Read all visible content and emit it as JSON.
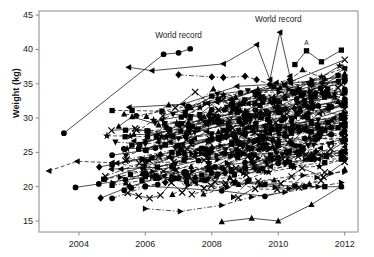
{
  "chart_data": {
    "type": "line",
    "title": "",
    "xlabel": "",
    "ylabel": "Weight (kg)",
    "xlim": [
      2002.8,
      2012.4
    ],
    "ylim": [
      13.4,
      45.6
    ],
    "xticks": [
      2004,
      2006,
      2008,
      2010,
      2012
    ],
    "xtick_labels": [
      "2004",
      "2006",
      "2008",
      "2010",
      "2012"
    ],
    "yticks": [
      15,
      20,
      25,
      30,
      35,
      40,
      45
    ],
    "ytick_labels": [
      "15",
      "20",
      "25",
      "30",
      "35",
      "40",
      "45"
    ],
    "grid": false,
    "legend": "none",
    "frame": "full-box",
    "marker_types": [
      "circle",
      "square",
      "triangle-up",
      "triangle-down",
      "triangle-left",
      "triangle-right",
      "diamond",
      "star",
      "x"
    ],
    "line_styles": [
      "solid",
      "dashed",
      "dash-dot"
    ],
    "color": "#000000",
    "annotations": [
      {
        "text": "World record",
        "x": 2007.0,
        "y": 41.6,
        "anchor": "middle"
      },
      {
        "text": "World record",
        "x": 2010.0,
        "y": 44.0,
        "anchor": "middle"
      },
      {
        "text": "A",
        "x": 2010.85,
        "y": 40.7,
        "anchor": "middle"
      },
      {
        "text": "B",
        "x": 2011.65,
        "y": 32.3,
        "anchor": "middle"
      }
    ],
    "series": [
      {
        "name": "world-record-early",
        "marker": "circle",
        "line": "solid",
        "x": [
          2003.55,
          2006.55,
          2007.0,
          2007.35
        ],
        "y": [
          27.8,
          39.3,
          39.5,
          40.1
        ]
      },
      {
        "name": "world-record-late",
        "marker": "triangle-left",
        "line": "solid",
        "x": [
          2005.5,
          2006.2,
          2008.35,
          2009.35,
          2009.75,
          2010.05,
          2010.35
        ],
        "y": [
          37.4,
          36.9,
          37.9,
          40.7,
          35.6,
          42.5,
          36.1
        ]
      },
      {
        "name": "diamond-high",
        "marker": "diamond",
        "line": "dash-dot",
        "x": [
          2007.0,
          2008.0,
          2008.35,
          2009.0,
          2009.35,
          2009.75,
          2010.35,
          2011.0,
          2011.8
        ],
        "y": [
          36.3,
          36.0,
          35.9,
          36.1,
          35.6,
          34.9,
          35.6,
          34.9,
          35.3
        ]
      },
      {
        "name": "square-31",
        "marker": "square",
        "line": "dashed",
        "x": [
          2005.0,
          2005.6,
          2006.5,
          2007.2,
          2008.0,
          2008.6,
          2009.4,
          2010.2,
          2011.0,
          2011.8
        ],
        "y": [
          31.1,
          31.1,
          31.0,
          30.8,
          33.2,
          32.0,
          33.5,
          34.8,
          35.0,
          36.2
        ]
      },
      {
        "name": "x-series-mid",
        "marker": "x",
        "line": "solid",
        "x": [
          2006.9,
          2007.5,
          2008.2,
          2009.0,
          2009.8,
          2010.6,
          2011.4,
          2011.9
        ],
        "y": [
          31.5,
          33.8,
          31.2,
          32.3,
          33.0,
          33.8,
          34.6,
          34.9
        ]
      },
      {
        "name": "triangle-up-mid",
        "marker": "triangle-up",
        "line": "solid",
        "x": [
          2005.2,
          2005.6,
          2006.4,
          2007.3,
          2008.2,
          2009.1,
          2010.0,
          2010.9,
          2011.8
        ],
        "y": [
          28.8,
          30.2,
          29.0,
          29.4,
          29.9,
          30.4,
          31.2,
          31.6,
          32.4
        ]
      },
      {
        "name": "triangle-down-mid",
        "marker": "triangle-down",
        "line": "dash-dot",
        "x": [
          2005.1,
          2006.0,
          2007.0,
          2008.0,
          2009.0,
          2010.0,
          2011.0,
          2011.9
        ],
        "y": [
          26.5,
          26.2,
          27.0,
          27.5,
          28.3,
          28.8,
          29.5,
          30.4
        ]
      },
      {
        "name": "circle-mid-a",
        "marker": "circle",
        "line": "solid",
        "x": [
          2005.0,
          2006.0,
          2007.0,
          2008.0,
          2009.0,
          2010.0,
          2011.0,
          2011.9
        ],
        "y": [
          24.6,
          25.3,
          26.0,
          27.0,
          27.8,
          28.6,
          29.2,
          30.0
        ]
      },
      {
        "name": "square-mid-a",
        "marker": "square",
        "line": "dashed",
        "x": [
          2005.0,
          2005.9,
          2006.8,
          2007.7,
          2008.6,
          2009.5,
          2010.4,
          2011.3,
          2011.9
        ],
        "y": [
          23.2,
          24.0,
          25.0,
          25.6,
          26.4,
          27.0,
          27.8,
          28.4,
          29.0
        ]
      },
      {
        "name": "triangle-left-low",
        "marker": "triangle-left",
        "line": "dashed",
        "x": [
          2003.1,
          2003.95,
          2005.0,
          2006.1,
          2007.2,
          2008.3,
          2009.4,
          2010.5,
          2011.6
        ],
        "y": [
          22.3,
          23.7,
          23.5,
          23.9,
          24.3,
          24.9,
          25.4,
          25.9,
          26.4
        ]
      },
      {
        "name": "circle-low-a",
        "marker": "circle",
        "line": "solid",
        "x": [
          2003.9,
          2004.6,
          2005.4,
          2006.3,
          2007.2,
          2008.1,
          2009.0,
          2010.0,
          2011.0,
          2011.9
        ],
        "y": [
          19.9,
          20.4,
          21.0,
          21.6,
          22.2,
          22.9,
          23.5,
          24.2,
          24.6,
          25.0
        ]
      },
      {
        "name": "square-low-b",
        "marker": "square",
        "line": "dash-dot",
        "x": [
          2005.0,
          2005.9,
          2006.8,
          2007.7,
          2008.6,
          2009.5,
          2010.4,
          2011.4,
          2011.9
        ],
        "y": [
          20.2,
          20.9,
          21.4,
          21.7,
          22.2,
          22.6,
          23.0,
          23.5,
          24.0
        ]
      },
      {
        "name": "triangle-right-low",
        "marker": "triangle-right",
        "line": "dash-dot",
        "x": [
          2006.0,
          2007.05,
          2008.3,
          2009.2,
          2010.2,
          2011.2,
          2011.9
        ],
        "y": [
          16.8,
          16.4,
          17.3,
          18.5,
          19.2,
          20.0,
          20.6
        ]
      },
      {
        "name": "triangle-up-lowest",
        "marker": "triangle-up",
        "line": "solid",
        "x": [
          2008.3,
          2009.2,
          2010.0,
          2011.0,
          2011.9
        ],
        "y": [
          14.9,
          15.4,
          15.0,
          17.4,
          20.1
        ]
      },
      {
        "name": "star-high-right",
        "marker": "star",
        "line": "solid",
        "x": [
          2009.9,
          2010.6,
          2011.3,
          2011.85
        ],
        "y": [
          32.5,
          34.3,
          36.0,
          37.6
        ]
      },
      {
        "name": "square-A",
        "marker": "square",
        "line": "solid",
        "x": [
          2010.5,
          2010.85,
          2011.3,
          2011.9
        ],
        "y": [
          37.8,
          39.8,
          38.2,
          39.9
        ]
      },
      {
        "name": "diamond-B",
        "marker": "diamond",
        "line": "dashed",
        "x": [
          2010.2,
          2010.9,
          2011.5,
          2011.9
        ],
        "y": [
          29.9,
          30.7,
          31.4,
          31.9
        ]
      },
      {
        "name": "circle-mid-b",
        "marker": "circle",
        "line": "dash-dot",
        "x": [
          2005.0,
          2006.0,
          2007.0,
          2008.0,
          2009.0,
          2010.0,
          2011.0,
          2011.9
        ],
        "y": [
          18.3,
          20.0,
          21.3,
          22.0,
          22.8,
          23.4,
          24.0,
          24.6
        ]
      },
      {
        "name": "square-mid-c",
        "marker": "square",
        "line": "solid",
        "x": [
          2005.8,
          2006.6,
          2007.4,
          2008.2,
          2009.0,
          2009.8,
          2010.6,
          2011.5
        ],
        "y": [
          25.5,
          26.1,
          26.6,
          27.2,
          27.8,
          28.3,
          28.7,
          29.3
        ]
      },
      {
        "name": "triangle-down-mid-b",
        "marker": "triangle-down",
        "line": "dashed",
        "x": [
          2005.9,
          2006.9,
          2007.9,
          2008.9,
          2009.9,
          2010.9,
          2011.9
        ],
        "y": [
          22.6,
          23.3,
          24.0,
          24.7,
          25.3,
          26.0,
          26.7
        ]
      },
      {
        "name": "x-series-low",
        "marker": "x",
        "line": "dashed",
        "x": [
          2005.4,
          2006.4,
          2007.4,
          2008.4,
          2009.4,
          2010.4,
          2011.4
        ],
        "y": [
          23.8,
          24.4,
          18.9,
          20.1,
          20.8,
          21.5,
          22.1
        ]
      },
      {
        "name": "circle-cluster-a",
        "marker": "circle",
        "line": "solid",
        "x": [
          2006.0,
          2006.8,
          2007.6,
          2008.4,
          2009.2,
          2010.0,
          2010.8,
          2011.6
        ],
        "y": [
          22.0,
          22.9,
          23.8,
          24.8,
          25.6,
          26.4,
          27.0,
          27.6
        ]
      },
      {
        "name": "square-cluster-b",
        "marker": "square",
        "line": "dash-dot",
        "x": [
          2006.2,
          2007.0,
          2007.8,
          2008.6,
          2009.4,
          2010.2,
          2011.0,
          2011.8
        ],
        "y": [
          24.2,
          24.9,
          25.5,
          26.2,
          26.8,
          27.4,
          28.0,
          28.6
        ]
      },
      {
        "name": "triangle-down-cluster",
        "marker": "triangle-down",
        "line": "solid",
        "x": [
          2006.4,
          2007.2,
          2008.0,
          2008.8,
          2009.6,
          2010.4,
          2011.2,
          2011.9
        ],
        "y": [
          26.8,
          27.2,
          27.7,
          28.2,
          28.7,
          29.2,
          29.7,
          30.2
        ]
      },
      {
        "name": "diamond-cluster",
        "marker": "diamond",
        "line": "dashed",
        "x": [
          2006.6,
          2007.5,
          2008.4,
          2009.3,
          2010.2,
          2011.1,
          2011.9
        ],
        "y": [
          20.6,
          21.3,
          22.0,
          22.7,
          23.4,
          24.0,
          24.6
        ]
      },
      {
        "name": "triangle-left-cluster",
        "marker": "triangle-left",
        "line": "dash-dot",
        "x": [
          2007.0,
          2007.9,
          2008.8,
          2009.7,
          2010.6,
          2011.5
        ],
        "y": [
          28.9,
          29.4,
          29.9,
          30.4,
          30.8,
          31.3
        ]
      },
      {
        "name": "star-mid",
        "marker": "star",
        "line": "solid",
        "x": [
          2008.2,
          2009.0,
          2009.9,
          2010.8,
          2011.7
        ],
        "y": [
          30.2,
          30.9,
          31.6,
          32.3,
          33.0
        ]
      },
      {
        "name": "x-cluster-high",
        "marker": "x",
        "line": "dash-dot",
        "x": [
          2008.6,
          2009.4,
          2010.2,
          2011.0,
          2011.8
        ],
        "y": [
          32.4,
          32.9,
          33.4,
          33.9,
          34.4
        ]
      },
      {
        "name": "square-dip",
        "marker": "square",
        "line": "solid",
        "x": [
          2006.0,
          2006.9,
          2007.8,
          2008.7,
          2009.6,
          2010.5,
          2011.4
        ],
        "y": [
          21.5,
          21.2,
          20.9,
          20.6,
          20.3,
          20.1,
          20.0
        ]
      },
      {
        "name": "circle-dip-low",
        "marker": "circle",
        "line": "solid",
        "x": [
          2006.0,
          2008.3,
          2009.6,
          2010.8,
          2011.9
        ],
        "y": [
          20.1,
          19.4,
          18.6,
          20.0,
          20.0
        ]
      }
    ]
  }
}
